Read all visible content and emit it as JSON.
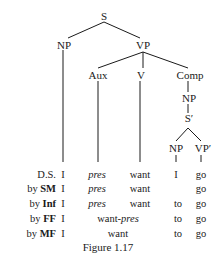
{
  "tree": {
    "nodes": {
      "S": "S",
      "NP": "NP",
      "VP": "VP",
      "Aux": "Aux",
      "V": "V",
      "Comp": "Comp",
      "Comp_NP": "NP",
      "S_bar": "S′",
      "low_NP": "NP",
      "low_VP": "VP′"
    }
  },
  "derivation": {
    "rows": [
      {
        "prefix": "",
        "label": "D.S.",
        "subj": "I",
        "aux": "pres",
        "verb": "want",
        "comp_np": "I",
        "comp_to": "",
        "vp": "go"
      },
      {
        "prefix": "by",
        "label": "SM",
        "subj": "I",
        "aux": "pres",
        "verb": "want",
        "comp_np": "",
        "comp_to": "",
        "vp": "go"
      },
      {
        "prefix": "by",
        "label": "Inf",
        "subj": "I",
        "aux": "pres",
        "verb": "want",
        "comp_np": "",
        "comp_to": "to",
        "vp": "go"
      },
      {
        "prefix": "by",
        "label": "FF",
        "subj": "I",
        "merged_prefix": "want-",
        "merged_suffix": "pres",
        "comp_to": "to",
        "vp": "go"
      },
      {
        "prefix": "by",
        "label": "MF",
        "subj": "I",
        "merged": "want",
        "comp_to": "to",
        "vp": "go"
      }
    ]
  },
  "caption": "Figure 1.17"
}
